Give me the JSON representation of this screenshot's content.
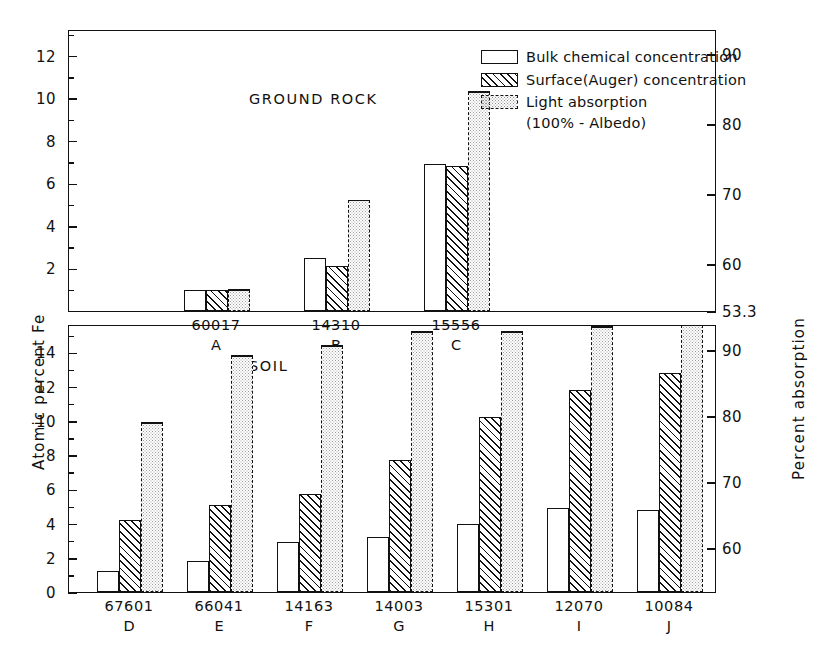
{
  "axes": {
    "left_title": "Atomic percent Fe",
    "right_title": "Percent absorption"
  },
  "legend": {
    "items": [
      {
        "key": "bulk",
        "label": "Bulk chemical concentration"
      },
      {
        "key": "surface",
        "label": "Surface(Auger) concentration"
      },
      {
        "key": "light",
        "label": "Light absorption"
      }
    ],
    "sub_label": "(100% - Albedo)"
  },
  "chart_data": [
    {
      "type": "bar",
      "title": "GROUND ROCK",
      "panel": "top",
      "xlabel": "",
      "ylabel": "Atomic percent Fe",
      "y2label": "Percent absorption",
      "ylim": [
        0,
        13.2
      ],
      "y2lim": [
        53.3,
        93.4
      ],
      "yticks": [
        2,
        4,
        6,
        8,
        10,
        12
      ],
      "yticklabels": [
        "2",
        "4",
        "6",
        "8",
        "10",
        "12"
      ],
      "y2ticks": [
        53.3,
        60,
        70,
        80,
        90
      ],
      "y2ticklabels": [
        "53.3",
        "60",
        "70",
        "80",
        "90"
      ],
      "grid": false,
      "legend_position": "top-right",
      "categories": [
        "60017",
        "14310",
        "15556"
      ],
      "category_letters": [
        "A",
        "B",
        "C"
      ],
      "series": [
        {
          "name": "Bulk chemical concentration",
          "values": [
            1.0,
            2.5,
            6.9
          ]
        },
        {
          "name": "Surface(Auger) concentration",
          "values": [
            1.0,
            2.1,
            6.8
          ]
        },
        {
          "name": "Light absorption (100% - Albedo)",
          "values": [
            1.0,
            5.2,
            10.3
          ]
        }
      ]
    },
    {
      "type": "bar",
      "title": "SOIL",
      "panel": "bottom",
      "xlabel": "",
      "ylabel": "Atomic percent Fe",
      "y2label": "Percent absorption",
      "ylim": [
        0,
        15.6
      ],
      "y2lim": [
        53.3,
        93.8
      ],
      "yticks": [
        0,
        2,
        4,
        6,
        8,
        10,
        12,
        14
      ],
      "yticklabels": [
        "0",
        "2",
        "4",
        "6",
        "8",
        "10",
        "12",
        "14"
      ],
      "y2ticks": [
        60,
        70,
        80,
        90
      ],
      "y2ticklabels": [
        "60",
        "70",
        "80",
        "90"
      ],
      "grid": false,
      "categories": [
        "67601",
        "66041",
        "14163",
        "14003",
        "15301",
        "12070",
        "10084"
      ],
      "category_letters": [
        "D",
        "E",
        "F",
        "G",
        "H",
        "I",
        "J"
      ],
      "series": [
        {
          "name": "Bulk chemical concentration",
          "values": [
            1.2,
            1.8,
            2.9,
            3.2,
            4.0,
            4.9,
            4.8
          ]
        },
        {
          "name": "Surface(Auger) concentration",
          "values": [
            4.2,
            5.1,
            5.7,
            7.7,
            10.2,
            11.8,
            12.8
          ]
        },
        {
          "name": "Light absorption (100% - Albedo)",
          "values": [
            9.9,
            13.8,
            14.4,
            15.2,
            15.2,
            15.5,
            15.6
          ]
        }
      ]
    }
  ]
}
